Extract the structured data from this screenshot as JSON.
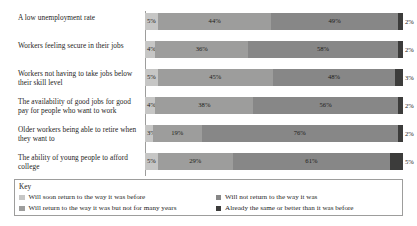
{
  "chart_data": {
    "type": "bar",
    "subtype": "stacked-horizontal-100",
    "title": "",
    "xlabel": "",
    "ylabel": "",
    "xlim": [
      0,
      100
    ],
    "grid": false,
    "legend_position": "bottom",
    "categories": [
      "A low unemployment rate",
      "Workers feeling secure in their jobs",
      "Workers not having to take jobs below their skill level",
      "The availability of good jobs for good pay for people who want to work",
      "Older workers being able to retire when they want to",
      "The ability of young people to afford college"
    ],
    "series": [
      {
        "name": "Will soon return to the way it was before",
        "color": "#c6c6c5",
        "values": [
          5,
          4,
          5,
          4,
          3,
          5
        ]
      },
      {
        "name": "Will return to the way it was but not for many years",
        "color": "#9d9d9c",
        "values": [
          44,
          36,
          45,
          38,
          19,
          29
        ]
      },
      {
        "name": "Will not return to the way it was",
        "color": "#878787",
        "values": [
          49,
          58,
          48,
          56,
          76,
          61
        ]
      },
      {
        "name": "Already the same or better than it was before",
        "color": "#3c3c3b",
        "values": [
          2,
          2,
          3,
          2,
          2,
          5
        ]
      }
    ],
    "value_suffix": "%",
    "value_labels": [
      [
        "5%",
        "44%",
        "49%",
        "2%"
      ],
      [
        "4%",
        "36%",
        "58%",
        "2%"
      ],
      [
        "5%",
        "45%",
        "48%",
        "3%"
      ],
      [
        "4%",
        "38%",
        "56%",
        "2%"
      ],
      [
        "3%",
        "19%",
        "76%",
        "2%"
      ],
      [
        "5%",
        "29%",
        "61%",
        "5%"
      ]
    ]
  },
  "key": {
    "title": "Key",
    "items": [
      {
        "label": "Will soon return to the way it was before",
        "color": "#c6c6c5"
      },
      {
        "label": "Will not return to the way it was",
        "color": "#878787"
      },
      {
        "label": "Will return to the way it was but not for many years",
        "color": "#9d9d9c"
      },
      {
        "label": "Already the same or better than it was before",
        "color": "#3c3c3b"
      }
    ]
  }
}
